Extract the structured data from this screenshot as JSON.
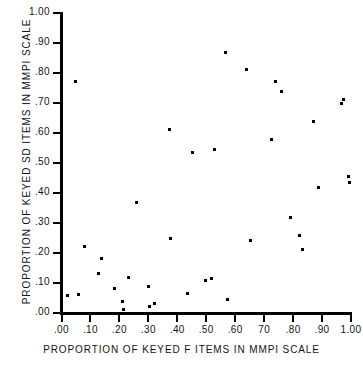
{
  "chart_data": {
    "type": "scatter",
    "title": "",
    "xlabel": "PROPORTION OF KEYED F ITEMS IN MMPI SCALE",
    "ylabel": "PROPORTION OF KEYED SD ITEMS IN MMPI SCALE",
    "xlim": [
      0.0,
      1.0
    ],
    "ylim": [
      0.0,
      1.0
    ],
    "grid": false,
    "legend": false,
    "xticks": [
      {
        "value": 0.0,
        "label": ".00"
      },
      {
        "value": 0.1,
        "label": ".10"
      },
      {
        "value": 0.2,
        "label": ".20"
      },
      {
        "value": 0.3,
        "label": ".30"
      },
      {
        "value": 0.4,
        "label": ".40"
      },
      {
        "value": 0.5,
        "label": ".50"
      },
      {
        "value": 0.6,
        "label": ".60"
      },
      {
        "value": 0.7,
        "label": "70"
      },
      {
        "value": 0.8,
        "label": ".80"
      },
      {
        "value": 0.9,
        "label": ".90"
      },
      {
        "value": 1.0,
        "label": "1.00"
      }
    ],
    "yticks": [
      {
        "value": 0.0,
        "label": ".00"
      },
      {
        "value": 0.1,
        "label": ".10"
      },
      {
        "value": 0.2,
        "label": ".20"
      },
      {
        "value": 0.3,
        "label": ".30"
      },
      {
        "value": 0.4,
        "label": ".40"
      },
      {
        "value": 0.5,
        "label": ".50"
      },
      {
        "value": 0.6,
        "label": ".60"
      },
      {
        "value": 0.7,
        "label": ".70"
      },
      {
        "value": 0.8,
        "label": ".80"
      },
      {
        "value": 0.9,
        "label": ".90"
      },
      {
        "value": 1.0,
        "label": "1.00"
      }
    ],
    "points": [
      [
        0.0,
        0.4
      ],
      [
        0.048,
        0.773
      ],
      [
        0.02,
        0.058
      ],
      [
        0.057,
        0.061
      ],
      [
        0.078,
        0.221
      ],
      [
        0.138,
        0.182
      ],
      [
        0.128,
        0.133
      ],
      [
        0.182,
        0.081
      ],
      [
        0.212,
        0.04
      ],
      [
        0.215,
        0.013
      ],
      [
        0.232,
        0.119
      ],
      [
        0.258,
        0.368
      ],
      [
        0.3,
        0.09
      ],
      [
        0.305,
        0.022
      ],
      [
        0.32,
        0.033
      ],
      [
        0.372,
        0.611
      ],
      [
        0.378,
        0.25
      ],
      [
        0.435,
        0.066
      ],
      [
        0.452,
        0.536
      ],
      [
        0.497,
        0.107
      ],
      [
        0.519,
        0.115
      ],
      [
        0.528,
        0.545
      ],
      [
        0.565,
        0.87
      ],
      [
        0.572,
        0.046
      ],
      [
        0.64,
        0.812
      ],
      [
        0.652,
        0.243
      ],
      [
        0.727,
        0.58
      ],
      [
        0.74,
        0.772
      ],
      [
        0.76,
        0.738
      ],
      [
        0.79,
        0.318
      ],
      [
        0.822,
        0.259
      ],
      [
        0.832,
        0.212
      ],
      [
        0.872,
        0.637
      ],
      [
        0.888,
        0.42
      ],
      [
        0.968,
        0.697
      ],
      [
        0.975,
        0.712
      ],
      [
        0.992,
        0.456
      ],
      [
        0.995,
        0.434
      ],
      [
        0.005,
        0.0
      ],
      [
        0.02,
        0.0
      ],
      [
        0.035,
        0.0
      ],
      [
        0.05,
        0.0
      ],
      [
        0.062,
        0.0
      ],
      [
        0.075,
        0.0
      ],
      [
        0.088,
        0.0
      ],
      [
        0.1,
        0.0
      ],
      [
        0.112,
        0.0
      ],
      [
        0.125,
        0.0
      ],
      [
        0.138,
        0.0
      ],
      [
        0.15,
        0.0
      ],
      [
        0.162,
        0.0
      ],
      [
        0.175,
        0.0
      ],
      [
        0.188,
        0.0
      ],
      [
        0.2,
        0.0
      ],
      [
        0.212,
        0.0
      ],
      [
        0.225,
        0.0
      ],
      [
        0.238,
        0.0
      ],
      [
        0.25,
        0.0
      ],
      [
        0.262,
        0.0
      ],
      [
        0.275,
        0.0
      ],
      [
        0.3,
        0.0
      ],
      [
        0.312,
        0.0
      ],
      [
        0.325,
        0.0
      ],
      [
        0.338,
        0.0
      ],
      [
        0.35,
        0.0
      ],
      [
        0.362,
        0.0
      ],
      [
        0.375,
        0.0
      ],
      [
        0.388,
        0.0
      ],
      [
        0.4,
        0.0
      ],
      [
        0.412,
        0.0
      ],
      [
        0.425,
        0.0
      ],
      [
        0.438,
        0.0
      ],
      [
        0.45,
        0.0
      ],
      [
        0.462,
        0.0
      ],
      [
        0.475,
        0.0
      ],
      [
        0.488,
        0.0
      ],
      [
        0.5,
        0.0
      ],
      [
        0.512,
        0.0
      ],
      [
        0.525,
        0.0
      ],
      [
        0.538,
        0.0
      ],
      [
        0.55,
        0.0
      ],
      [
        0.562,
        0.0
      ],
      [
        0.575,
        0.0
      ],
      [
        0.588,
        0.0
      ],
      [
        0.6,
        0.0
      ],
      [
        0.612,
        0.0
      ],
      [
        0.632,
        0.0
      ],
      [
        0.645,
        0.0
      ],
      [
        0.658,
        0.0
      ],
      [
        0.682,
        0.0
      ],
      [
        0.742,
        0.0
      ],
      [
        0.8,
        0.0
      ],
      [
        0.832,
        0.0
      ]
    ]
  }
}
